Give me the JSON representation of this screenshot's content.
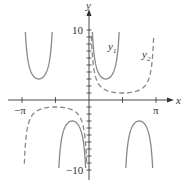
{
  "chart_data": {
    "type": "line",
    "title": "",
    "xlabel": "x",
    "ylabel": "y",
    "xlim": [
      -3.14159,
      3.14159
    ],
    "ylim": [
      -10,
      10
    ],
    "grid": false,
    "x_tick_labels": [
      {
        "value": -3.14159,
        "label": "−π"
      },
      {
        "value": 3.14159,
        "label": "π"
      }
    ],
    "x_ticks": [
      -3.14159,
      -1.5708,
      1.5708,
      3.14159
    ],
    "y_tick_labels": [
      {
        "value": 10,
        "label": "10"
      },
      {
        "value": -10,
        "label": "−10"
      }
    ],
    "y_tick_step": 1,
    "series": [
      {
        "name": "y1",
        "label": "y",
        "subscript": "1",
        "function": "3*csc(2x)",
        "style": "solid",
        "color": "#888888",
        "local_extrema": [
          {
            "x": -2.356,
            "y": 3
          },
          {
            "x": -0.785,
            "y": -3
          },
          {
            "x": 0.785,
            "y": 3
          },
          {
            "x": 2.356,
            "y": -3
          }
        ]
      },
      {
        "name": "y2",
        "label": "y",
        "subscript": "2",
        "function": "csc(x)",
        "style": "dashed",
        "color": "#888888",
        "local_extrema": [
          {
            "x": -1.5708,
            "y": -1
          },
          {
            "x": 1.5708,
            "y": 1
          }
        ]
      }
    ],
    "legend": "inline-labels"
  }
}
